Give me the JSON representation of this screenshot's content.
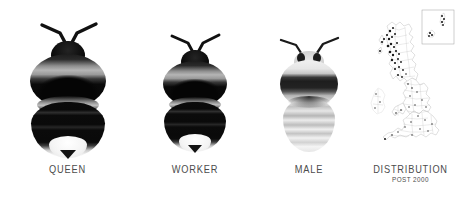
{
  "figure": {
    "background_color": "#ffffff",
    "width": 458,
    "height": 202,
    "text_color": "#4c4c4c"
  },
  "panels": [
    {
      "id": "queen",
      "label": "QUEEN",
      "sublabel": "",
      "type": "specimen-photo",
      "subject": "bumblebee-queen-dorsal",
      "description": "Dorsal view of a bumblebee queen, largest of the three castes",
      "body_color": "#0d0d0d",
      "band_color": "#9a9a9a",
      "tail_color": "#f2f2f2"
    },
    {
      "id": "worker",
      "label": "WORKER",
      "sublabel": "",
      "type": "specimen-photo",
      "subject": "bumblebee-worker-dorsal",
      "description": "Dorsal view of a bumblebee worker, smaller than the queen",
      "body_color": "#0d0d0d",
      "band_color": "#9a9a9a",
      "tail_color": "#f2f2f2"
    },
    {
      "id": "male",
      "label": "MALE",
      "sublabel": "",
      "type": "specimen-photo",
      "subject": "bumblebee-male-dorsal",
      "description": "Dorsal view of a male bumblebee, pale with a dark thoracic band",
      "body_color": "#d8d8d8",
      "band_color": "#2a2a2a",
      "tail_color": "#ededed"
    },
    {
      "id": "distribution",
      "label": "DISTRIBUTION",
      "sublabel": "POST 2000",
      "type": "distribution-map",
      "subject": "united-kingdom-vice-county-map",
      "description": "Outline map of Great Britain and Ireland with vice-county boundaries and recorded occurrence dots, plus an inset box of the northern isles",
      "outline_color": "#b9b9b9",
      "dot_color": "#1a1a1a",
      "inset_border_color": "#9e9e9e"
    }
  ]
}
